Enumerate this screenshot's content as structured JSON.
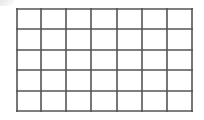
{
  "grid": {
    "columns": 7,
    "rows": 5,
    "line_color": "#555555",
    "background_color": "#ffffff",
    "x_lines": [
      0,
      25,
      50,
      75,
      101,
      126,
      151,
      177
    ],
    "y_lines": [
      0,
      21,
      42,
      62,
      83,
      104
    ]
  }
}
